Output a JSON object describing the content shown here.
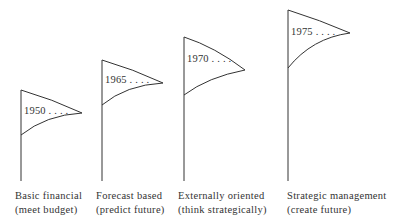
{
  "diagram": {
    "type": "evolution-of-planning-flags",
    "stroke_color": "#333333",
    "stages": [
      {
        "year": "1950 . . . .",
        "label_line1": "Basic financial",
        "label_line2": "(meet budget)"
      },
      {
        "year": "1965 . . . .",
        "label_line1": "Forecast based",
        "label_line2": "(predict future)"
      },
      {
        "year": "1970 . . . .",
        "label_line1": "Externally oriented",
        "label_line2": "(think strategically)"
      },
      {
        "year": "1975 . . . .",
        "label_line1": "Strategic management",
        "label_line2": "(create future)"
      }
    ]
  }
}
